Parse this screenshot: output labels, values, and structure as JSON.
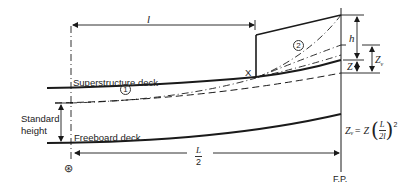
{
  "labels": {
    "superstructure_deck": "Superstructure deck",
    "freeboard_deck": "Freeboard deck",
    "standard_height_line1": "Standard",
    "standard_height_line2": "height",
    "length_l": "l",
    "half_length_num": "L",
    "half_length_den": "2",
    "point_x": "X",
    "curve_1": "1",
    "curve_2": "2",
    "dim_h": "h",
    "dim_z": "Z",
    "dim_zv_main": "Z",
    "dim_zv_sub": "v",
    "forward_perpendicular": "F.P.",
    "midship_symbol": "⊛"
  },
  "formula": {
    "lhs_main": "Z",
    "lhs_sub": "v",
    "equals": " = Z",
    "frac_num": "L",
    "frac_den": "2l",
    "exponent": "2"
  },
  "colors": {
    "line": "#1a1a1a",
    "text": "#222222",
    "background": "#ffffff"
  }
}
